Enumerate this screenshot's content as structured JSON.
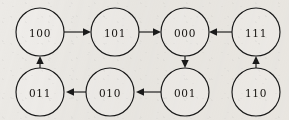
{
  "diagram": {
    "type": "directed-graph",
    "background_color": "#eceae6",
    "stroke_color": "#1a1a1a",
    "node_fill_color": "#efedea",
    "node_radius": 24,
    "nodes": [
      {
        "id": "100",
        "label": "100",
        "cx": 40,
        "cy": 32
      },
      {
        "id": "101",
        "label": "101",
        "cx": 115,
        "cy": 32
      },
      {
        "id": "000",
        "label": "000",
        "cx": 185,
        "cy": 32
      },
      {
        "id": "111",
        "label": "111",
        "cx": 256,
        "cy": 32
      },
      {
        "id": "011",
        "label": "011",
        "cx": 40,
        "cy": 92
      },
      {
        "id": "010",
        "label": "010",
        "cx": 110,
        "cy": 92
      },
      {
        "id": "001",
        "label": "001",
        "cx": 185,
        "cy": 92
      },
      {
        "id": "110",
        "label": "110",
        "cx": 256,
        "cy": 92
      }
    ],
    "edges": [
      {
        "from": "100",
        "to": "101",
        "direction": "right"
      },
      {
        "from": "101",
        "to": "000",
        "direction": "right"
      },
      {
        "from": "111",
        "to": "000",
        "direction": "left"
      },
      {
        "from": "000",
        "to": "001",
        "direction": "down"
      },
      {
        "from": "001",
        "to": "010",
        "direction": "left"
      },
      {
        "from": "010",
        "to": "011",
        "direction": "left"
      },
      {
        "from": "011",
        "to": "100",
        "direction": "up"
      },
      {
        "from": "110",
        "to": "111",
        "direction": "up"
      }
    ]
  }
}
